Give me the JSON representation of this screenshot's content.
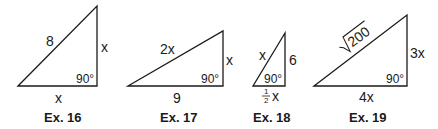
{
  "diagram": {
    "type": "right-triangle exercises",
    "stroke_color": "#1a1a1a",
    "triangles": [
      {
        "id": "ex16",
        "caption": "Ex. 16",
        "hypotenuse": "8",
        "vertical_leg": "x",
        "horizontal_leg": "x",
        "right_angle": "90°"
      },
      {
        "id": "ex17",
        "caption": "Ex. 17",
        "hypotenuse": "2x",
        "vertical_leg": "x",
        "horizontal_leg": "9",
        "right_angle": "90°"
      },
      {
        "id": "ex18",
        "caption": "Ex. 18",
        "hypotenuse": "x",
        "vertical_leg": "6",
        "horizontal_leg_num": "1",
        "horizontal_leg_den": "2",
        "horizontal_leg_var": "x",
        "right_angle": "90°"
      },
      {
        "id": "ex19",
        "caption": "Ex. 19",
        "hypotenuse_radicand": "200",
        "vertical_leg": "3x",
        "horizontal_leg": "4x",
        "right_angle": "90°"
      }
    ]
  }
}
